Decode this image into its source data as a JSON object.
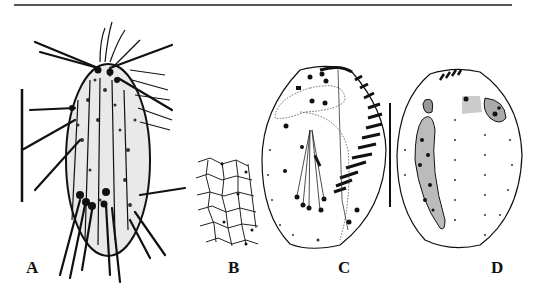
{
  "figure": {
    "panels": [
      {
        "id": "A",
        "label": "A",
        "content": "ciliate body with cirri, stippled cytoplasm",
        "has_scale_bar": true
      },
      {
        "id": "B",
        "label": "B",
        "content": "cortical granule/silverline reticulate pattern"
      },
      {
        "id": "C",
        "label": "C",
        "content": "ventral view: adoral zone of membranelles, cirri, undulating membranes"
      },
      {
        "id": "D",
        "label": "D",
        "content": "dorsal view: macronucleus, dorsal kineties"
      }
    ],
    "scale_bars": [
      {
        "panel": "A",
        "orientation": "vertical"
      },
      {
        "panel": "C-D",
        "orientation": "vertical"
      }
    ],
    "colors": {
      "ink": "#111111",
      "rule": "#555555",
      "background": "#ffffff"
    }
  }
}
